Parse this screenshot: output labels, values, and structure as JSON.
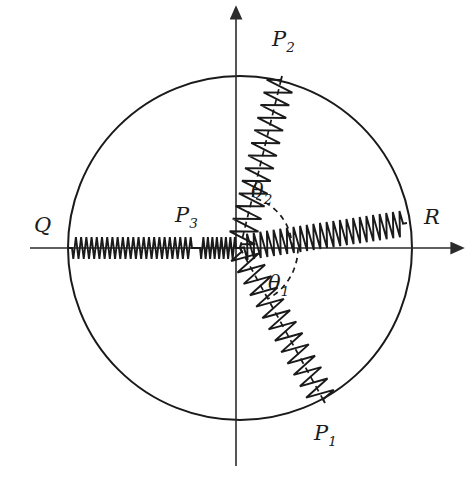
{
  "figure": {
    "background_color": "#ffffff",
    "ink_color": "#1a1a1a",
    "width": 471,
    "height": 485
  },
  "geometry": {
    "center": {
      "x": 240,
      "y": 248
    },
    "radius": 172,
    "x_axis": {
      "x1": 30,
      "y1": 248,
      "x2": 452,
      "y2": 248,
      "arrow": "right"
    },
    "y_axis": {
      "x1": 236,
      "y1": 466,
      "x2": 236,
      "y2": 18,
      "arrow": "up"
    }
  },
  "labels": {
    "Q": {
      "text": "Q",
      "sub": "",
      "x": 34,
      "y": 232
    },
    "R": {
      "text": "R",
      "sub": "",
      "x": 424,
      "y": 224
    },
    "P1": {
      "text": "P",
      "sub": "1",
      "x": 314,
      "y": 440
    },
    "P2": {
      "text": "P",
      "sub": "2",
      "x": 272,
      "y": 46
    },
    "P3": {
      "text": "P",
      "sub": "3",
      "x": 175,
      "y": 222
    },
    "theta1": {
      "text": "θ",
      "sub": "1",
      "x": 268,
      "y": 290
    },
    "theta2": {
      "text": "θ",
      "sub": "2",
      "x": 251,
      "y": 198
    }
  },
  "nodes": [
    {
      "name": "Q",
      "x": 68,
      "y": 248,
      "radius": 5.2,
      "on": "circle-left-boundary"
    },
    {
      "name": "P3",
      "x": 196,
      "y": 248,
      "radius": 6.4,
      "on": "x-axis-interior"
    },
    {
      "name": "R",
      "x": 407,
      "y": 223,
      "radius": 5.2,
      "on": "circle-right-boundary"
    },
    {
      "name": "P2",
      "x": 282,
      "y": 76,
      "radius": 7.6,
      "on": "circle-upper-right"
    },
    {
      "name": "P1",
      "x": 325,
      "y": 403,
      "radius": 7.6,
      "on": "circle-lower-right"
    }
  ],
  "springs": [
    {
      "name": "spring-Q-P3",
      "from": "Q",
      "to": "P3",
      "coils": 23,
      "amplitude": 11
    },
    {
      "name": "spring-P3-origin",
      "from": "P3",
      "to": "origin",
      "coils": 8,
      "amplitude": 11
    },
    {
      "name": "spring-origin-R",
      "from": "origin",
      "to": "R",
      "coils": 24,
      "amplitude": 13
    },
    {
      "name": "spring-origin-P2",
      "from": "origin",
      "to": "P2",
      "coils": 13,
      "amplitude": 14
    },
    {
      "name": "spring-origin-P1",
      "from": "origin",
      "to": "P1",
      "coils": 13,
      "amplitude": 14
    }
  ],
  "angles": {
    "theta1": {
      "name": "theta-1-arc",
      "from_axis": "positive-x",
      "to": "P1",
      "sweep_deg": -55,
      "arc_radius": 58
    },
    "theta2": {
      "name": "theta-2-arc",
      "from_axis": "positive-x",
      "to": "P2",
      "sweep_deg": 74,
      "arc_radius": 52
    }
  },
  "dashed_radii": [
    {
      "name": "radius-to-P1",
      "from": "origin",
      "to": "P1"
    },
    {
      "name": "radius-to-P2",
      "from": "origin",
      "to": "P2"
    }
  ]
}
